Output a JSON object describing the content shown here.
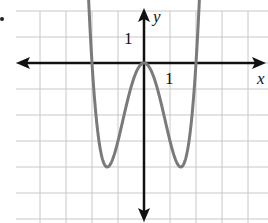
{
  "chart_data": {
    "type": "line",
    "title": "",
    "xlabel": "x",
    "ylabel": "y",
    "function": "y = x^4 - 4x^2",
    "xlim": [
      -4.9,
      4.7
    ],
    "ylim": [
      -6.0,
      2.0
    ],
    "grid": true,
    "grid_spacing": 1,
    "tick_labels": {
      "x": [
        "1"
      ],
      "y": [
        "1"
      ]
    },
    "key_points": [
      {
        "x": -2,
        "y": 0,
        "note": "x-intercept"
      },
      {
        "x": -1.414,
        "y": -4,
        "note": "local minimum"
      },
      {
        "x": 0,
        "y": 0,
        "note": "local maximum"
      },
      {
        "x": 1.414,
        "y": -4,
        "note": "local minimum"
      },
      {
        "x": 2,
        "y": 0,
        "note": "x-intercept"
      }
    ],
    "series": [
      {
        "name": "f(x)",
        "color": "#7a7a7a",
        "x": [
          -2.25,
          -2,
          -1.75,
          -1.5,
          -1.414,
          -1.25,
          -1,
          -0.75,
          -0.5,
          -0.25,
          0,
          0.25,
          0.5,
          0.75,
          1,
          1.25,
          1.414,
          1.5,
          1.75,
          2,
          2.25
        ],
        "values": [
          5.38,
          0,
          -2.87,
          -3.94,
          -4,
          -3.81,
          -3,
          -1.93,
          -0.94,
          -0.25,
          0,
          -0.25,
          -0.94,
          -1.93,
          -3,
          -3.81,
          -4,
          -3.94,
          -2.87,
          0,
          5.38
        ]
      }
    ]
  },
  "labels": {
    "x_axis": "x",
    "y_axis": "y",
    "x_tick": "1",
    "y_tick": "1"
  },
  "colors": {
    "curve": "#7a7a7a",
    "axis": "#111111",
    "grid": "#c8c8c8"
  }
}
